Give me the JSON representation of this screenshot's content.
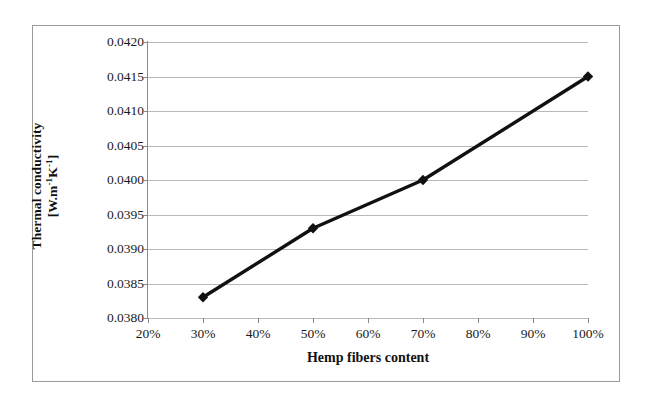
{
  "chart_data": {
    "type": "line",
    "title": "",
    "xlabel": "Hemp fibers content",
    "ylabel_line1": "Thermal conductivity",
    "ylabel_line2_prefix": "[W.m",
    "ylabel_line2_sup1": "-1",
    "ylabel_line2_mid": "K",
    "ylabel_line2_sup2": "-1",
    "ylabel_line2_suffix": "]",
    "x": [
      30,
      50,
      70,
      100
    ],
    "x_labels": [
      "30%",
      "50%",
      "70%",
      "100%"
    ],
    "values": [
      0.0383,
      0.0393,
      0.04,
      0.0415
    ],
    "xlim": [
      20,
      100
    ],
    "ylim": [
      0.038,
      0.042
    ],
    "x_ticks": [
      20,
      30,
      40,
      50,
      60,
      70,
      80,
      90,
      100
    ],
    "x_tick_labels": [
      "20%",
      "30%",
      "40%",
      "50%",
      "60%",
      "70%",
      "80%",
      "90%",
      "100%"
    ],
    "y_ticks": [
      0.038,
      0.0385,
      0.039,
      0.0395,
      0.04,
      0.0405,
      0.041,
      0.0415,
      0.042
    ],
    "y_tick_labels": [
      "0.0380",
      "0.0385",
      "0.0390",
      "0.0395",
      "0.0400",
      "0.0405",
      "0.0410",
      "0.0415",
      "0.0420"
    ],
    "grid": "horizontal",
    "legend": "none",
    "marker": "diamond",
    "series_color": "#111111",
    "gridline_color": "#b9b9b9",
    "axis_color": "#8a8a8a",
    "background_color": "#ffffff",
    "frame_color": "#9a9a9a"
  }
}
